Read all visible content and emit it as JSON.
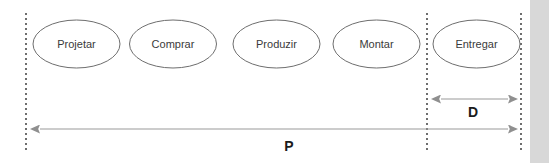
{
  "diagram": {
    "type": "process-flow-lead-time",
    "background_color": "#ffffff",
    "nodes": [
      {
        "id": "projetar",
        "label": "Projetar",
        "cx": 76.5,
        "cy": 44
      },
      {
        "id": "comprar",
        "label": "Comprar",
        "cx": 173,
        "cy": 44
      },
      {
        "id": "produzir",
        "label": "Produzir",
        "cx": 276.5,
        "cy": 44
      },
      {
        "id": "montar",
        "label": "Montar",
        "cx": 376.5,
        "cy": 44
      },
      {
        "id": "entregar",
        "label": "Entregar",
        "cx": 476.5,
        "cy": 44
      }
    ],
    "node_shape": {
      "rx": 43.5,
      "ry": 24,
      "fill": "#ffffff",
      "stroke": "#6e6e6e"
    },
    "boundaries": [
      {
        "id": "left-boundary",
        "x": 26,
        "y1": 13,
        "y2": 153
      },
      {
        "id": "middle-boundary",
        "x": 427,
        "y1": 13,
        "y2": 153
      },
      {
        "id": "right-boundary",
        "x": 521,
        "y1": 13,
        "y2": 153
      }
    ],
    "boundary_color": "#4a4a4a",
    "measures": [
      {
        "id": "delivery",
        "label": "D",
        "x1": 430,
        "x2": 518,
        "y": 99,
        "label_x": 473,
        "label_y": 112,
        "arrows": "both"
      },
      {
        "id": "production",
        "label": "P",
        "x1": 29,
        "x2": 518,
        "y": 129,
        "label_x": 289,
        "label_y": 146,
        "arrows": "both"
      }
    ],
    "measure_line_color": "#9a9a9a",
    "side_band": {
      "id": "right-band",
      "x": 530,
      "width": 19,
      "color": "#d8d8d8"
    }
  }
}
